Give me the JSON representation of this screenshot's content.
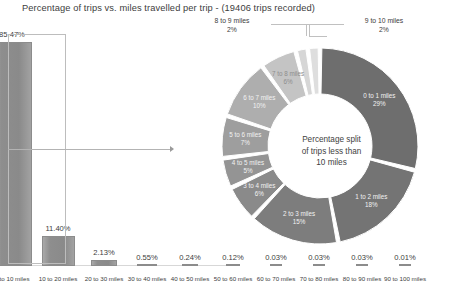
{
  "chart_data": {
    "type": "bar",
    "title": "Percentage of trips vs. miles travelled per trip - (19406 trips recorded)",
    "xlabel": "",
    "ylabel": "",
    "ylim": [
      0,
      85.47
    ],
    "grid": false,
    "legend": "none",
    "categories": [
      "0 to 10 miles",
      "10 to 20 miles",
      "20 to 30 miles",
      "30 to 40 miles",
      "40 to 50 miles",
      "50 to 60 miles",
      "60 to 70 miles",
      "70 to 80 miles",
      "80 to 90 miles",
      "90 to 100 miles"
    ],
    "values": [
      85.47,
      11.4,
      2.13,
      0.55,
      0.24,
      0.12,
      0.03,
      0.03,
      0.03,
      0.01
    ],
    "value_labels": [
      "85.47%",
      "11.40%",
      "2.13%",
      "0.55%",
      "0.24%",
      "0.12%",
      "0.03%",
      "0.03%",
      "0.03%",
      "0.01%"
    ]
  },
  "donut_data": {
    "type": "pie",
    "center_text_line1": "Percentage split",
    "center_text_line2": "of trips less than",
    "center_text_line3": "10 miles",
    "categories": [
      "0 to 1 miles",
      "1 to 2 miles",
      "2 to 3 miles",
      "3 to 4 miles",
      "4 to 5 miles",
      "5 to 6 miles",
      "6 to 7 miles",
      "7 to 8 miles",
      "8 to 9 miles",
      "9 to 10 miles"
    ],
    "values": [
      29,
      18,
      15,
      6,
      5,
      7,
      10,
      6,
      2,
      2
    ],
    "value_labels": [
      "29%",
      "18%",
      "15%",
      "6%",
      "5%",
      "7%",
      "10%",
      "6%",
      "2%",
      "2%"
    ],
    "colors": [
      "#6e6e6e",
      "#747474",
      "#7d7d7d",
      "#8a8a8a",
      "#949494",
      "#9e9e9e",
      "#aeaeae",
      "#c4c4c4",
      "#d6d6d6",
      "#dedede"
    ]
  },
  "callouts": [
    {
      "label": "8 to 9 miles",
      "value": "2%"
    },
    {
      "label": "9 to 10 miles",
      "value": "2%"
    }
  ]
}
